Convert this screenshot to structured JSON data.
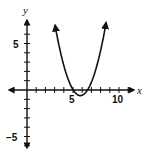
{
  "chart_data": {
    "type": "line",
    "title": "",
    "xlabel": "x",
    "ylabel": "y",
    "x_tick_labels": [
      "5",
      "10"
    ],
    "y_tick_labels": [
      "5",
      "−5"
    ],
    "xlim": [
      -1,
      12
    ],
    "ylim": [
      -7,
      7
    ],
    "grid": false,
    "legend": null,
    "series": [
      {
        "name": "parabola",
        "description": "upward-opening parabola, x-intercepts ≈ 4.7 and ≈ 6.9, vertex ≈ (5.8, −0.6)",
        "approx_equation": "y = (x - 5.8)^2 - 0.6",
        "x": [
          3.0,
          3.5,
          4.0,
          4.5,
          4.7,
          5.0,
          5.5,
          5.8,
          6.0,
          6.5,
          6.9,
          7.0,
          7.5,
          8.0,
          8.6
        ],
        "y": [
          7.2,
          4.7,
          2.6,
          1.1,
          0.0,
          0.04,
          -0.51,
          -0.6,
          -0.56,
          -0.11,
          0.0,
          0.84,
          2.29,
          4.24,
          7.24
        ]
      }
    ],
    "annotations": [
      "arrowheads on both ends of the curve",
      "arrowheads on both ends of each axis"
    ]
  },
  "labels": {
    "x_axis": "x",
    "y_axis": "y",
    "x_tick_5": "5",
    "x_tick_10": "10",
    "y_tick_5": "5",
    "y_tick_neg5": "−5"
  }
}
